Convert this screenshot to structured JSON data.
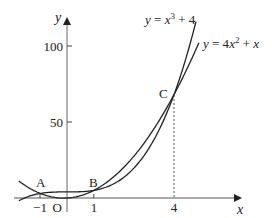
{
  "chart_data": {
    "type": "line",
    "title": "",
    "xlabel": "x",
    "ylabel": "y",
    "xlim": [
      -1.8,
      4.95
    ],
    "ylim": [
      -2,
      120
    ],
    "grid": false,
    "x_ticks": [
      {
        "value": -1,
        "label": "−1"
      },
      {
        "value": 0,
        "label": "O"
      },
      {
        "value": 1,
        "label": "1"
      },
      {
        "value": 4,
        "label": "4"
      }
    ],
    "y_ticks": [
      {
        "value": 50,
        "label": "50"
      },
      {
        "value": 100,
        "label": "100"
      }
    ],
    "series": [
      {
        "name": "y = x³ + 4",
        "expression": "x^3 + 4",
        "label_text": "y = x³ + 4",
        "x_range": [
          -1.8,
          4.82
        ]
      },
      {
        "name": "y = 4x² + x",
        "expression": "4*x^2 + x",
        "label_text": "y = 4x² + x",
        "x_range": [
          -1.8,
          4.93
        ]
      }
    ],
    "points": [
      {
        "label": "A",
        "x": -1,
        "y": 3
      },
      {
        "label": "B",
        "x": 1,
        "y": 5
      },
      {
        "label": "C",
        "x": 4,
        "y": 68
      }
    ],
    "annotations": [
      {
        "type": "dashed-vertical",
        "from": {
          "x": 4,
          "y": 68
        },
        "to": {
          "x": 4,
          "y": 0
        }
      }
    ]
  },
  "labels": {
    "y_axis": "y",
    "x_axis": "x",
    "cubic": "y = x³ + 4",
    "quadratic": "y = 4x² + x",
    "point_a": "A",
    "point_b": "B",
    "point_c": "C",
    "tick_100": "100",
    "tick_50": "50",
    "tick_neg1": "−1",
    "origin": "O",
    "tick_1": "1",
    "tick_4": "4"
  }
}
